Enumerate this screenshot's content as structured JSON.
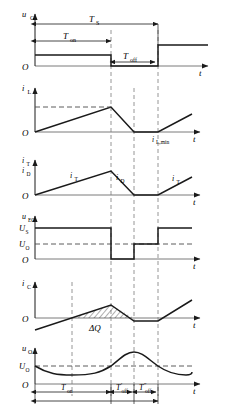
{
  "figure": {
    "axis_time_label": "t",
    "origin_label": "O",
    "colors": {
      "waveform": "#1a1a1a",
      "axis": "#7a7a7a",
      "dashed_guide": "#8a8a8a",
      "background": "#ffffff"
    }
  },
  "timing": {
    "Ts": "T",
    "Ts_sub": "S",
    "Ton": "T",
    "Ton_sub": "on",
    "Toff": "T",
    "Toff_sub": "off",
    "Toff_prime": "T",
    "Toff_prime_sub": "off",
    "Toff_prime_mark": "′",
    "Toff_dprime": "T",
    "Toff_dprime_sub": "off",
    "Toff_dprime_mark": "″",
    "x_start": 35,
    "x_on_end": 111,
    "x_off1_end": 134,
    "x_period_end": 158
  },
  "panels": [
    {
      "id": "gate-voltage",
      "ylabel": "u",
      "ylabel_sub": "G",
      "origin": "O",
      "taxis": "t",
      "type": "square",
      "levels": [
        "high",
        "low",
        "high"
      ],
      "annotations": [
        "Ts",
        "Ton",
        "Toff"
      ]
    },
    {
      "id": "inductor-current",
      "ylabel": "i",
      "ylabel_sub": "L",
      "origin": "O",
      "taxis": "t",
      "type": "triangular",
      "peak_guide": true,
      "min_label": "i",
      "min_label_sub": "L,min"
    },
    {
      "id": "switch-diode-current",
      "ylabel_1": "i",
      "ylabel_1_sub": "T",
      "ylabel_2": "i",
      "ylabel_2_sub": "D",
      "origin": "O",
      "taxis": "t",
      "type": "triangular",
      "curve_labels": [
        {
          "text": "i",
          "sub": "T"
        },
        {
          "text": "i",
          "sub": "D"
        },
        {
          "text": "i",
          "sub": "T"
        }
      ]
    },
    {
      "id": "node-voltage",
      "ylabel": "u",
      "ylabel_sub": "EO",
      "origin": "O",
      "taxis": "t",
      "type": "three-level",
      "level_high": "U",
      "level_high_sub": "S",
      "level_mid": "U",
      "level_mid_sub": "O"
    },
    {
      "id": "capacitor-current",
      "ylabel": "i",
      "ylabel_sub": "C",
      "origin": "O",
      "taxis": "t",
      "type": "triangular-shifted",
      "charge_label": "ΔQ"
    },
    {
      "id": "output-voltage",
      "ylabel": "u",
      "ylabel_sub": "O",
      "origin": "O",
      "taxis": "t",
      "type": "ripple",
      "mean_level": "U",
      "mean_level_sub": "O",
      "annotations": [
        "Ton",
        "Toff_prime",
        "Toff_dprime"
      ]
    }
  ]
}
